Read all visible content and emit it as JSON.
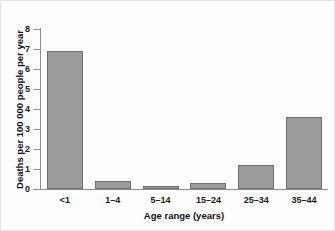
{
  "chart_data": {
    "type": "bar",
    "title": "",
    "xlabel": "Age range (years)",
    "ylabel": "Deaths per 100 000 people per year",
    "categories": [
      "<1",
      "1–4",
      "5–14",
      "15–24",
      "25–34",
      "35–44"
    ],
    "values": [
      6.9,
      0.38,
      0.15,
      0.3,
      1.2,
      3.6
    ],
    "ylim": [
      0,
      8
    ],
    "ytick_labels": [
      "0",
      "1",
      "2",
      "3",
      "4",
      "5",
      "6",
      "7",
      "8"
    ],
    "ytick_values": [
      0,
      1,
      2,
      3,
      4,
      5,
      6,
      7,
      8
    ],
    "grid": false,
    "legend": "none",
    "bar_color": "#9b9b9b",
    "bar_edge_color": "#6f6f6f",
    "axis_color": "#8d8d8d",
    "background_color": "#fdfdfd"
  }
}
